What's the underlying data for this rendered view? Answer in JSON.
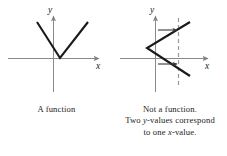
{
  "figures": [
    {
      "id": "function-graph",
      "name": "a-function-graph",
      "axis_labels": {
        "x": "x",
        "y": "y"
      },
      "caption_lines": [
        "A function"
      ],
      "shape": "v-shape-opening-up",
      "stroke_color": "#1a1a1a",
      "axis_color": "#808080",
      "vertex": {
        "x": 60,
        "y": 58
      },
      "arm_endpoints": [
        {
          "x": 37,
          "y": 22
        },
        {
          "x": 88,
          "y": 22
        }
      ],
      "origin": {
        "x": 53,
        "y": 58
      }
    },
    {
      "id": "not-a-function-graph",
      "name": "not-a-function-graph",
      "axis_labels": {
        "x": "x",
        "y": "y"
      },
      "caption_lines": [
        "Not a function.",
        "Two y-values correspond",
        "to one x-value."
      ],
      "shape": "v-shape-opening-right",
      "stroke_color": "#1a1a1a",
      "axis_color": "#808080",
      "dashed_line_color": "#9a9a9a",
      "vertex": {
        "x": 34,
        "y": 48
      },
      "arm_endpoints": [
        {
          "x": 77,
          "y": 22
        },
        {
          "x": 77,
          "y": 76
        }
      ],
      "origin": {
        "x": 42,
        "y": 58
      },
      "vertical_test_line_x": 65,
      "intersection_points": [
        {
          "x": 65,
          "y": 30
        },
        {
          "x": 65,
          "y": 64
        }
      ]
    }
  ],
  "caption_right_segments": {
    "line1": "Not a function.",
    "line2_pre": "Two ",
    "line2_var": "y",
    "line2_post": "-values correspond",
    "line3_pre": "to one ",
    "line3_var": "x",
    "line3_post": "-value."
  },
  "caption_left": {
    "line1": "A function"
  }
}
